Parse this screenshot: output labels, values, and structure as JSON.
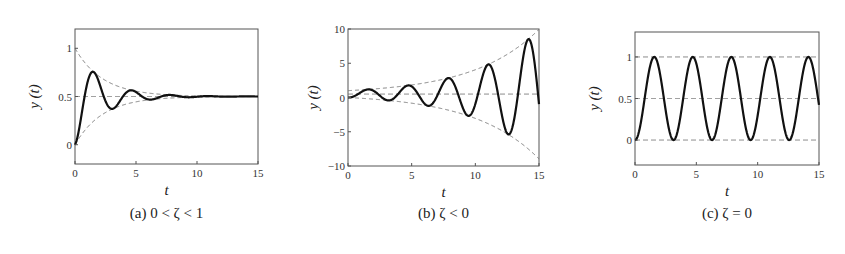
{
  "figure": {
    "width": 845,
    "height": 254
  },
  "chart_data": [
    {
      "id": "a",
      "type": "line",
      "caption": "(a)  0 < ζ < 1",
      "caption_tag": "(a)",
      "caption_cond": "0 < ζ < 1",
      "xlabel": "t",
      "ylabel": "y (t)",
      "xlim": [
        0,
        15
      ],
      "ylim": [
        -0.2,
        1.2
      ],
      "xticks": [
        0,
        5,
        10,
        15
      ],
      "xtick_labels": [
        "0",
        "5",
        "10",
        "15"
      ],
      "yticks": [
        0,
        0.5,
        1
      ],
      "ytick_labels": [
        "0",
        "0.5",
        "1"
      ],
      "grid": false,
      "box": {
        "left": 75,
        "top": 29,
        "right": 258,
        "bottom": 164
      },
      "model": "y(t) = 0.5 - 0.5*exp(sigma*t)*cos(omega*t)",
      "params": {
        "steady": 0.5,
        "amp": 0.5,
        "sigma": -0.44,
        "omega": 2.0
      },
      "series": [
        {
          "name": "response",
          "style": "solid",
          "key_points": {
            "t": [
              0,
              1.6,
              3.1,
              4.7,
              6.3,
              7.9,
              15
            ],
            "y": [
              0,
              0.75,
              0.38,
              0.56,
              0.47,
              0.51,
              0.5
            ]
          }
        },
        {
          "name": "upper envelope",
          "style": "dashed",
          "formula": "0.5 + 0.5*exp(sigma*t)",
          "start": 1.0
        },
        {
          "name": "lower envelope",
          "style": "dashed",
          "formula": "0.5 - 0.5*exp(sigma*t)",
          "start": 0.0
        },
        {
          "name": "steady state",
          "style": "dashed",
          "value": 0.5
        }
      ]
    },
    {
      "id": "b",
      "type": "line",
      "caption": "(b)  ζ < 0",
      "caption_tag": "(b)",
      "caption_cond": "ζ < 0",
      "xlabel": "t",
      "ylabel": "y (t)",
      "xlim": [
        0,
        15
      ],
      "ylim": [
        -10,
        10
      ],
      "xticks": [
        0,
        5,
        10,
        15
      ],
      "xtick_labels": [
        "0",
        "5",
        "10",
        "15"
      ],
      "yticks": [
        -10,
        -5,
        0,
        5,
        10
      ],
      "ytick_labels": [
        "-10",
        "-5",
        "0",
        "5",
        "10"
      ],
      "grid": false,
      "box": {
        "left": 348,
        "top": 29,
        "right": 539,
        "bottom": 166
      },
      "model": "y(t) = 0.5 - 0.5*exp(sigma*t)*cos(omega*t)",
      "params": {
        "steady": 0.5,
        "amp": 0.5,
        "sigma": 0.196,
        "omega": 2.0
      },
      "series": [
        {
          "name": "response",
          "style": "solid",
          "key_points": {
            "t": [
              0,
              1.6,
              3.1,
              4.7,
              6.3,
              7.9,
              9.4,
              11.0,
              12.6,
              14.2
            ],
            "y": [
              0,
              1.2,
              -0.4,
              1.8,
              -1.2,
              2.9,
              -2.8,
              5.0,
              -5.8,
              9.0
            ]
          }
        },
        {
          "name": "upper envelope",
          "style": "dashed",
          "formula": "0.5 + 0.5*exp(sigma*t)",
          "end": 10.0
        },
        {
          "name": "lower envelope",
          "style": "dashed",
          "formula": "0.5 - 0.5*exp(sigma*t)",
          "end": -9.0
        },
        {
          "name": "steady state",
          "style": "dashed",
          "value": 0.5
        }
      ]
    },
    {
      "id": "c",
      "type": "line",
      "caption": "(c)  ζ = 0",
      "caption_tag": "(c)",
      "caption_cond": "ζ = 0",
      "xlabel": "t",
      "ylabel": "y (t)",
      "xlim": [
        0,
        15
      ],
      "ylim": [
        -0.3,
        1.3
      ],
      "xticks": [
        0,
        5,
        10,
        15
      ],
      "xtick_labels": [
        "0",
        "5",
        "10",
        "15"
      ],
      "yticks": [
        0,
        0.5,
        1
      ],
      "ytick_labels": [
        "0",
        "0.5",
        "1"
      ],
      "grid": false,
      "box": {
        "left": 635,
        "top": 32,
        "right": 819,
        "bottom": 165
      },
      "model": "y(t) = 0.5 - 0.5*exp(sigma*t)*cos(omega*t)",
      "params": {
        "steady": 0.5,
        "amp": 0.5,
        "sigma": 0.0,
        "omega": 2.0
      },
      "series": [
        {
          "name": "response",
          "style": "solid",
          "key_points": {
            "t": [
              0,
              1.57,
              3.14,
              4.71,
              6.28,
              7.85,
              9.42,
              11.0,
              12.57,
              14.14,
              15
            ],
            "y": [
              0,
              1,
              0,
              1,
              0,
              1,
              0,
              1,
              0,
              1,
              0.42
            ]
          }
        },
        {
          "name": "upper bound",
          "style": "dashed",
          "value": 1.0
        },
        {
          "name": "steady state",
          "style": "dashed",
          "value": 0.5
        },
        {
          "name": "lower bound",
          "style": "dashed",
          "value": 0.0
        }
      ]
    }
  ]
}
